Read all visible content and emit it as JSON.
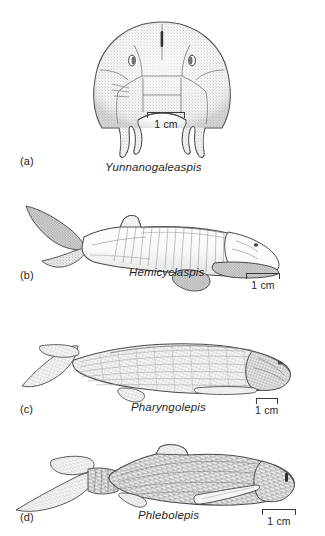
{
  "figure": {
    "panels": [
      {
        "id": "a",
        "letter": "(a)",
        "genus": "Yunnanogaleaspis",
        "scale": {
          "label": "1 cm",
          "length_px": 38
        },
        "artwork_name": "yunnanogaleaspis-head-shield-drawing"
      },
      {
        "id": "b",
        "letter": "(b)",
        "genus": "Hemicyclaspis",
        "scale": {
          "label": "1 cm",
          "length_px": 34
        },
        "artwork_name": "hemicyclaspis-body-drawing"
      },
      {
        "id": "c",
        "letter": "(c)",
        "genus": "Pharyngolepis",
        "scale": {
          "label": "1 cm",
          "length_px": 22
        },
        "artwork_name": "pharyngolepis-body-drawing"
      },
      {
        "id": "d",
        "letter": "(d)",
        "genus": "Phlebolepis",
        "scale": {
          "label": "1 cm",
          "length_px": 34
        },
        "artwork_name": "phlebolepis-body-drawing"
      }
    ]
  },
  "style": {
    "ink": "#3a3a3a",
    "fill_light": "#f2f2f2",
    "fill_shade": "#c9c9c9",
    "background": "#ffffff"
  }
}
